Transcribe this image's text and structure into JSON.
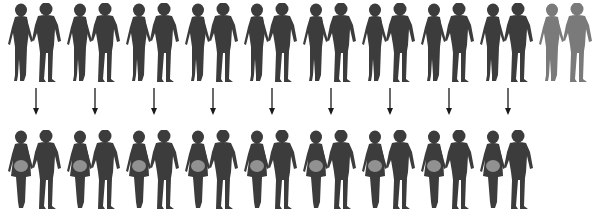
{
  "diagram": {
    "colors": {
      "silhouette": "#3c3c3c",
      "silhouette_faded": "#7a7a7a",
      "belly_glow": "#9a9a9a",
      "arrow": "#1a1a1a",
      "background": "#ffffff"
    },
    "top_row": {
      "count": 10,
      "couples": [
        {
          "x": 6,
          "faded": false
        },
        {
          "x": 65,
          "faded": false
        },
        {
          "x": 124,
          "faded": false
        },
        {
          "x": 183,
          "faded": false
        },
        {
          "x": 242,
          "faded": false
        },
        {
          "x": 301,
          "faded": false
        },
        {
          "x": 360,
          "faded": false
        },
        {
          "x": 419,
          "faded": false
        },
        {
          "x": 478,
          "faded": false
        },
        {
          "x": 537,
          "faded": true
        }
      ]
    },
    "arrows": {
      "count": 9,
      "x": [
        36,
        95,
        154,
        213,
        272,
        331,
        390,
        449,
        508
      ]
    },
    "bottom_row": {
      "count": 9,
      "state": "pregnant",
      "x": [
        6,
        65,
        124,
        183,
        242,
        301,
        360,
        419,
        478
      ]
    }
  }
}
